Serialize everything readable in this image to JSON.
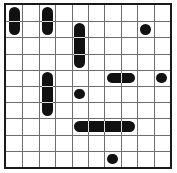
{
  "board": {
    "title": "domino-puzzle-grid",
    "columns": 10,
    "rows": 10,
    "cell_size": 16.4,
    "grid_line_color": "#6e6e6e",
    "border_color": "#1a1a1a",
    "piece_color": "#111111",
    "background_color": "#ffffff"
  },
  "pieces": [
    {
      "name": "vertical-domino-c0-r0",
      "shape": "vertical",
      "col": 0,
      "row": 0,
      "length": 2
    },
    {
      "name": "vertical-domino-c2-r0",
      "shape": "vertical",
      "col": 2,
      "row": 0,
      "length": 2
    },
    {
      "name": "vertical-triple-c4-r1",
      "shape": "vertical",
      "col": 4,
      "row": 1,
      "length": 3
    },
    {
      "name": "single-dot-c8-r1",
      "shape": "dot",
      "col": 8,
      "row": 1,
      "length": 1
    },
    {
      "name": "vertical-triple-c2-r4",
      "shape": "vertical",
      "col": 2,
      "row": 4,
      "length": 3
    },
    {
      "name": "horizontal-domino-c6-r4",
      "shape": "horizontal",
      "col": 6,
      "row": 4,
      "length": 2
    },
    {
      "name": "single-dot-c9-r4",
      "shape": "dot",
      "col": 9,
      "row": 4,
      "length": 1
    },
    {
      "name": "single-dot-c4-r5",
      "shape": "dot",
      "col": 4,
      "row": 5,
      "length": 1
    },
    {
      "name": "horizontal-quad-c4-r7",
      "shape": "horizontal",
      "col": 4,
      "row": 7,
      "length": 4
    },
    {
      "name": "single-dot-c6-r9",
      "shape": "dot",
      "col": 6,
      "row": 9,
      "length": 1
    }
  ]
}
